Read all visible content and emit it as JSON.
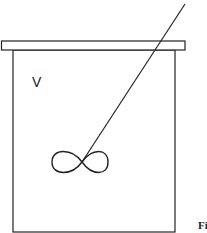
{
  "diagram": {
    "volume_label": "V",
    "figure_caption": "Fi",
    "elements": [
      "vessel",
      "lid",
      "stirrer-shaft",
      "impeller"
    ],
    "stroke_color": "#222222"
  }
}
